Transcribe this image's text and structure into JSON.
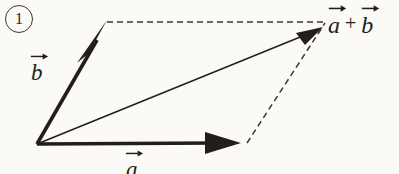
{
  "figure": {
    "item_number": "1",
    "caption_note": "",
    "background_color": "#fbfaf7",
    "ink_color": "#211e1b",
    "width": 399,
    "height": 174
  },
  "labels": {
    "vector_a": {
      "letter": "a",
      "arrow_icon": "over-right-arrow"
    },
    "vector_b": {
      "letter": "b",
      "arrow_icon": "over-right-arrow"
    },
    "resultant": {
      "first_letter": "a",
      "operator": "+",
      "second_letter": "b",
      "arrow_icon": "over-right-arrow"
    }
  },
  "geometry": {
    "origin": {
      "x": 37,
      "y": 144
    },
    "tip_a": {
      "x": 240,
      "y": 143
    },
    "tip_b": {
      "x": 107,
      "y": 22
    },
    "tip_sum": {
      "x": 322,
      "y": 28
    },
    "corner_far": {
      "x": 325,
      "y": 22
    },
    "dashed_base_end": {
      "x": 247,
      "y": 143
    },
    "vectors": [
      {
        "name": "vector-a",
        "style": "solid-thick",
        "x1": 37,
        "y1": 144,
        "x2": 240,
        "y2": 143,
        "arrowhead": "filled-triangle"
      },
      {
        "name": "vector-b",
        "style": "solid-thick",
        "x1": 37,
        "y1": 144,
        "x2": 107,
        "y2": 22,
        "arrowhead": "filled-concave"
      },
      {
        "name": "vector-sum",
        "style": "solid-thin",
        "x1": 37,
        "y1": 144,
        "x2": 322,
        "y2": 28,
        "arrowhead": "filled-triangle"
      }
    ],
    "construction_lines": [
      {
        "name": "dashed-top",
        "x1": 107,
        "y1": 22,
        "x2": 325,
        "y2": 22
      },
      {
        "name": "dashed-right",
        "x1": 247,
        "y1": 143,
        "x2": 325,
        "y2": 23
      }
    ]
  }
}
